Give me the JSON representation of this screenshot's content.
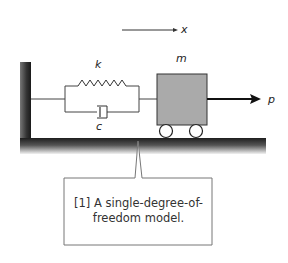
{
  "diagram": {
    "type": "mass-spring-damper",
    "labels": {
      "displacement": "x",
      "stiffness": "k",
      "damping": "c",
      "mass": "m",
      "force": "p"
    },
    "colors": {
      "mass_fill": "#aaaaaa",
      "line": "#333333",
      "ground": "#2a2a2a"
    }
  },
  "callout": {
    "line1": "[1] A single-degree-of-",
    "line2": "freedom model."
  }
}
